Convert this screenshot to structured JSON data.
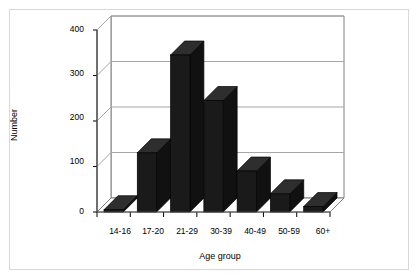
{
  "figure": {
    "frame_color": "#d8d8d8",
    "background": "#ffffff",
    "bar_color": "#1a1a1a",
    "bar_top_color": "#2e2e2e",
    "bar_side_color": "#111111",
    "gridline_color": "#a6a6a6",
    "axis_color": "#808080"
  },
  "chart_data": {
    "type": "bar",
    "title": "",
    "xlabel": "Age group",
    "ylabel": "Number",
    "categories": [
      "14-16",
      "17-20",
      "21-29",
      "30-39",
      "40-49",
      "50-59",
      "60+"
    ],
    "values": [
      5,
      130,
      345,
      245,
      90,
      40,
      12
    ],
    "ylim": [
      0,
      400
    ],
    "yticks": [
      0,
      100,
      200,
      300,
      400
    ],
    "ytick_labels": [
      "0",
      "100",
      "200",
      "300",
      "400"
    ],
    "grid": true,
    "legend": "none",
    "style": "3d-column"
  }
}
